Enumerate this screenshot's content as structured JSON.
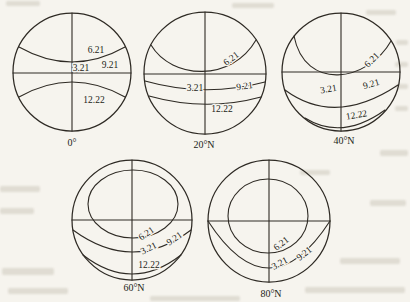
{
  "figure": {
    "background": "#f6f4ee",
    "ink": "#2e2a24",
    "diagrams": [
      {
        "latitude": "0°",
        "jun21": "6.21",
        "mar21": "3.21",
        "sep21": "9.21",
        "dec22": "12.22"
      },
      {
        "latitude": "20°N",
        "jun21": "6.21",
        "mar21": "3.21",
        "sep21": "9.21",
        "dec22": "12.22"
      },
      {
        "latitude": "40°N",
        "jun21": "6.21",
        "mar21": "3.21",
        "sep21": "9.21",
        "dec22": "12.22"
      },
      {
        "latitude": "60°N",
        "jun21": "6.21",
        "mar21": "3.21",
        "sep21": "9.21",
        "dec22": "12.22"
      },
      {
        "latitude": "80°N",
        "jun21": "6.21",
        "mar21": "3.21",
        "sep21": "9.21"
      }
    ]
  }
}
